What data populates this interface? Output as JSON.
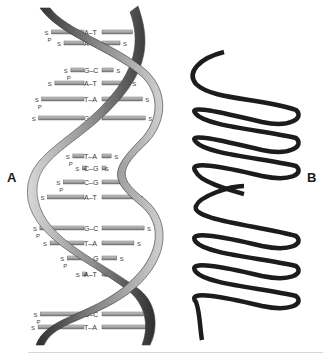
{
  "panels": {
    "a": {
      "label": "A",
      "title": "DNA double helix"
    },
    "b": {
      "label": "B",
      "title": "Coiled ribbon helix"
    }
  },
  "base_pairs": [
    {
      "label": "A–T",
      "y": 32
    },
    {
      "label": "A–T",
      "y": 43
    },
    {
      "label": "G–C",
      "y": 70
    },
    {
      "label": "A–T",
      "y": 83
    },
    {
      "label": "T–A",
      "y": 99
    },
    {
      "label": "G–C",
      "y": 118
    },
    {
      "label": "T–A",
      "y": 156
    },
    {
      "label": "C–G",
      "y": 168
    },
    {
      "label": "C–G",
      "y": 182
    },
    {
      "label": "A–T",
      "y": 197
    },
    {
      "label": "G–C",
      "y": 228
    },
    {
      "label": "T–A",
      "y": 243
    },
    {
      "label": "C–G",
      "y": 258
    },
    {
      "label": "A–T",
      "y": 274
    },
    {
      "label": "G–C",
      "y": 314
    },
    {
      "label": "T–A",
      "y": 327
    }
  ],
  "backbone_labels": {
    "sugar": "S",
    "phosphate": "P"
  },
  "colors": {
    "strand_dark": "#3a3a3a",
    "strand_mid": "#7a7a7a",
    "strand_light": "#c8c8c8",
    "rung_dark": "#6a6a6a",
    "rung_light": "#b5b5b5",
    "ribbon": "#1c1c1c"
  }
}
